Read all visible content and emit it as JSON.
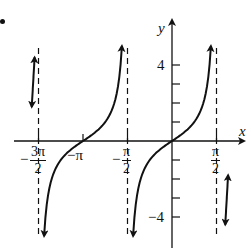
{
  "chart_data": {
    "type": "line",
    "title": "",
    "function": "y = tan(x)",
    "xlabel": "x",
    "ylabel": "y",
    "x_range": [
      -5.5,
      2.1
    ],
    "ylim": [
      -5,
      5.5
    ],
    "grid": false,
    "legend": null,
    "y_ticks": [
      -4,
      -3,
      -2,
      -1,
      1,
      2,
      3,
      4
    ],
    "y_tick_labels": [
      {
        "value": 4,
        "label": "4"
      },
      {
        "value": -4,
        "label": "−4"
      }
    ],
    "x_ticks": [
      {
        "value": -4.712,
        "label": "−3π/2"
      },
      {
        "value": -3.1416,
        "label": "−π"
      },
      {
        "value": -1.5708,
        "label": "−π/2"
      },
      {
        "value": 1.5708,
        "label": "π/2"
      }
    ],
    "asymptotes": [
      -4.712,
      -1.5708,
      1.5708
    ],
    "zeros": [
      -3.1416,
      0
    ],
    "series": [
      {
        "name": "branch-left-partial",
        "x": [
          -5.0,
          -4.8
        ],
        "note": "short arrowed segment left of x=−3π/2"
      },
      {
        "name": "branch-middle",
        "x_interval": [
          -4.712,
          -1.5708
        ],
        "crosses_zero_at": -3.1416
      },
      {
        "name": "branch-center",
        "x_interval": [
          -1.5708,
          1.5708
        ],
        "crosses_zero_at": 0
      },
      {
        "name": "branch-right-partial",
        "x": [
          1.75,
          1.95
        ],
        "note": "short arrowed segment right of x=π/2"
      }
    ]
  },
  "labels": {
    "x_axis": "x",
    "y_axis": "y",
    "y_pos4": "4",
    "y_neg4": "−4",
    "x_neg3pi2_sign": "−",
    "x_neg3pi2_num": "3π",
    "x_neg3pi2_den": "2",
    "x_negpi": "−π",
    "x_negpi2_sign": "−",
    "x_negpi2_num": "π",
    "x_negpi2_den": "2",
    "x_pi2_num": "π",
    "x_pi2_den": "2"
  },
  "colors": {
    "ink": "#111111",
    "background": "#ffffff"
  }
}
